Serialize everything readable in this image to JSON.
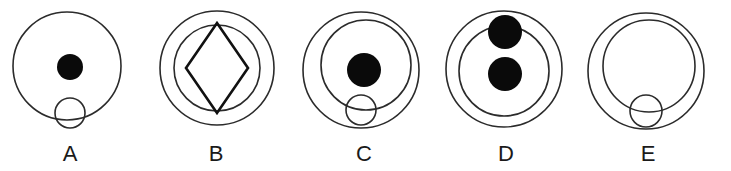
{
  "panel": {
    "background_color": "#ffffff",
    "stroke_color": "#2b2b2b",
    "fill_color": "#0a0a0a",
    "label_color": "#1a1a1a",
    "width": 731,
    "height": 171
  },
  "figures": [
    {
      "label": "A",
      "label_x": 70,
      "label_y": 161,
      "description": "one large circle containing a filled black disc above a small open circle",
      "shapes": [
        {
          "kind": "circle",
          "name": "outer-circle",
          "cx": 67,
          "cy": 66,
          "r": 54,
          "filled": false,
          "stroke_width": 1.6
        },
        {
          "kind": "circle",
          "name": "filled-disc",
          "cx": 70,
          "cy": 67,
          "r": 13,
          "filled": true,
          "stroke_width": 0
        },
        {
          "kind": "circle",
          "name": "small-open-circle",
          "cx": 70,
          "cy": 113,
          "r": 15,
          "filled": false,
          "stroke_width": 1.6
        }
      ]
    },
    {
      "label": "B",
      "label_x": 216,
      "label_y": 161,
      "description": "two concentric circles with an inscribed diamond",
      "shapes": [
        {
          "kind": "circle",
          "name": "outer-circle",
          "cx": 217,
          "cy": 68,
          "r": 57,
          "filled": false,
          "stroke_width": 1.6
        },
        {
          "kind": "circle",
          "name": "inner-circle",
          "cx": 217,
          "cy": 68,
          "r": 43,
          "filled": false,
          "stroke_width": 1.6
        },
        {
          "kind": "diamond",
          "name": "diamond",
          "cx": 217,
          "cy": 68,
          "rx": 31,
          "ry": 45,
          "filled": false,
          "stroke_width": 2.6
        }
      ]
    },
    {
      "label": "C",
      "label_x": 364,
      "label_y": 161,
      "description": "outer circle, offset inner circle, centered filled disc, small open circle straddling the inner circle bottom",
      "shapes": [
        {
          "kind": "circle",
          "name": "outer-circle",
          "cx": 361,
          "cy": 70,
          "r": 58,
          "filled": false,
          "stroke_width": 1.6
        },
        {
          "kind": "circle",
          "name": "inner-circle",
          "cx": 366,
          "cy": 65,
          "r": 45,
          "filled": false,
          "stroke_width": 1.6
        },
        {
          "kind": "circle",
          "name": "filled-disc",
          "cx": 364,
          "cy": 70,
          "r": 17,
          "filled": true,
          "stroke_width": 0
        },
        {
          "kind": "circle",
          "name": "small-open-circle",
          "cx": 361,
          "cy": 110,
          "r": 15,
          "filled": false,
          "stroke_width": 1.6
        }
      ]
    },
    {
      "label": "D",
      "label_x": 506,
      "label_y": 161,
      "description": "outer circle, inner circle, a filled disc straddling the inner circle top and a second filled disc at the centre",
      "shapes": [
        {
          "kind": "circle",
          "name": "outer-circle",
          "cx": 504,
          "cy": 69,
          "r": 58,
          "filled": false,
          "stroke_width": 1.6
        },
        {
          "kind": "circle",
          "name": "inner-circle",
          "cx": 504,
          "cy": 71,
          "r": 45,
          "filled": false,
          "stroke_width": 1.6
        },
        {
          "kind": "circle",
          "name": "filled-disc-top",
          "cx": 505,
          "cy": 32,
          "r": 17,
          "filled": true,
          "stroke_width": 0
        },
        {
          "kind": "circle",
          "name": "filled-disc-centre",
          "cx": 505,
          "cy": 74,
          "r": 17,
          "filled": true,
          "stroke_width": 0
        }
      ]
    },
    {
      "label": "E",
      "label_x": 648,
      "label_y": 161,
      "description": "outer circle, offset inner circle, small open circle straddling the inner circle bottom, no filled disc",
      "shapes": [
        {
          "kind": "circle",
          "name": "outer-circle",
          "cx": 646,
          "cy": 71,
          "r": 58,
          "filled": false,
          "stroke_width": 1.6
        },
        {
          "kind": "circle",
          "name": "inner-circle",
          "cx": 649,
          "cy": 66,
          "r": 46,
          "filled": false,
          "stroke_width": 1.6
        },
        {
          "kind": "circle",
          "name": "small-open-circle",
          "cx": 646,
          "cy": 111,
          "r": 16,
          "filled": false,
          "stroke_width": 1.6
        }
      ]
    }
  ]
}
